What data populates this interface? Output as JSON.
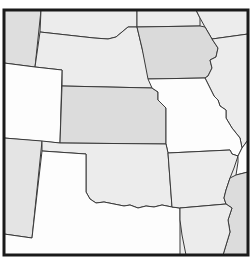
{
  "map": {
    "type": "regional US states outline map",
    "frame": {
      "x": 4,
      "y": 10,
      "width": 244,
      "height": 245,
      "border_color": "#1a1a1a"
    },
    "colors": {
      "white": "#fdfdfd",
      "light": "#ececec",
      "medium": "#dcdcdc",
      "border": "#3a3a3a"
    },
    "states": [
      {
        "id": "wyoming",
        "label": "",
        "fill": "#dedede"
      },
      {
        "id": "south-dakota",
        "label": "",
        "fill": "#ececec"
      },
      {
        "id": "nebraska",
        "label": "",
        "fill": "#ececec"
      },
      {
        "id": "minnesota",
        "label": "",
        "fill": "#ececec"
      },
      {
        "id": "iowa",
        "label": "",
        "fill": "#dadada"
      },
      {
        "id": "wisconsin",
        "label": "",
        "fill": "#ececec"
      },
      {
        "id": "colorado",
        "label": "",
        "fill": "#fdfdfd"
      },
      {
        "id": "kansas",
        "label": "",
        "fill": "#dcdcdc"
      },
      {
        "id": "missouri",
        "label": "",
        "fill": "#fdfdfd"
      },
      {
        "id": "illinois",
        "label": "",
        "fill": "#ececec"
      },
      {
        "id": "new-mexico",
        "label": "",
        "fill": "#e4e4e4"
      },
      {
        "id": "oklahoma",
        "label": "",
        "fill": "#ececec"
      },
      {
        "id": "texas",
        "label": "",
        "fill": "#fdfdfd"
      },
      {
        "id": "arkansas",
        "label": "",
        "fill": "#ececec"
      },
      {
        "id": "tennessee",
        "label": "",
        "fill": "#fdfdfd"
      },
      {
        "id": "mississippi",
        "label": "",
        "fill": "#dcdcdc"
      },
      {
        "id": "louisiana",
        "label": "",
        "fill": "#ececec"
      }
    ]
  }
}
